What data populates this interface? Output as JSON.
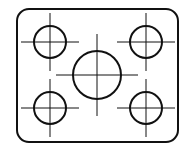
{
  "diagram": {
    "type": "technical-drawing",
    "stroke_color": "#111111",
    "background": "#ffffff",
    "plate": {
      "x": 17,
      "y": 9,
      "width": 161,
      "height": 133,
      "corner_radius": 12
    },
    "holes": [
      {
        "id": "top-left",
        "cx": 50,
        "cy": 42,
        "r": 16
      },
      {
        "id": "top-right",
        "cx": 146,
        "cy": 42,
        "r": 16
      },
      {
        "id": "center",
        "cx": 97,
        "cy": 75,
        "r": 24
      },
      {
        "id": "bottom-left",
        "cx": 50,
        "cy": 108,
        "r": 16
      },
      {
        "id": "bottom-right",
        "cx": 146,
        "cy": 108,
        "r": 16
      }
    ]
  }
}
